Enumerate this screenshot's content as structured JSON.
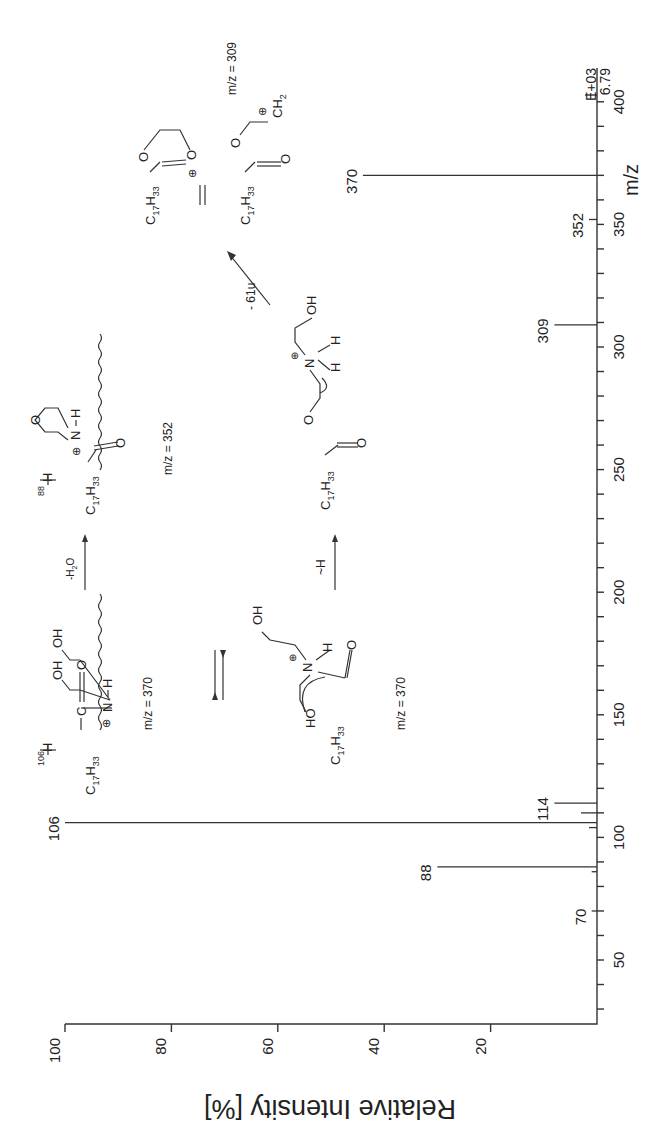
{
  "chart_data": {
    "type": "bar",
    "subtype": "mass-spectrum (stick plot, figure rotated 90° clockwise)",
    "title": "",
    "xlabel": "m/z",
    "ylabel": "Relative Intensity [%]",
    "xlim": [
      20,
      410
    ],
    "ylim": [
      0,
      100
    ],
    "x_ticks": [
      50,
      100,
      150,
      200,
      250,
      300,
      350,
      400
    ],
    "y_ticks": [
      20,
      40,
      60,
      80,
      100
    ],
    "scale_label_line1": "E+03",
    "scale_label_line2": "6.79",
    "peaks": [
      {
        "mz": 70,
        "intensity": 1,
        "label": "70"
      },
      {
        "mz": 86,
        "intensity": 1,
        "label": ""
      },
      {
        "mz": 88,
        "intensity": 30,
        "label": "88"
      },
      {
        "mz": 104,
        "intensity": 1.5,
        "label": ""
      },
      {
        "mz": 106,
        "intensity": 100,
        "label": "106"
      },
      {
        "mz": 110,
        "intensity": 3,
        "label": ""
      },
      {
        "mz": 114,
        "intensity": 8,
        "label": "114"
      },
      {
        "mz": 309,
        "intensity": 8,
        "label": "309"
      },
      {
        "mz": 352,
        "intensity": 1.5,
        "label": "352"
      },
      {
        "mz": 370,
        "intensity": 44,
        "label": "370"
      }
    ],
    "grid": false,
    "legend": "none"
  },
  "annotations": {
    "struct1_mz": "m/z = 370",
    "struct1_frag": "106",
    "struct2_mz": "m/z = 370",
    "struct3_mz": "m/z = 352",
    "struct3_frag": "88",
    "struct5_mz": "m/z = 309",
    "arrow_h2o": "-H2O",
    "arrow_h": "~H",
    "arrow_61u": "- 61u",
    "chain": "C17H33"
  }
}
